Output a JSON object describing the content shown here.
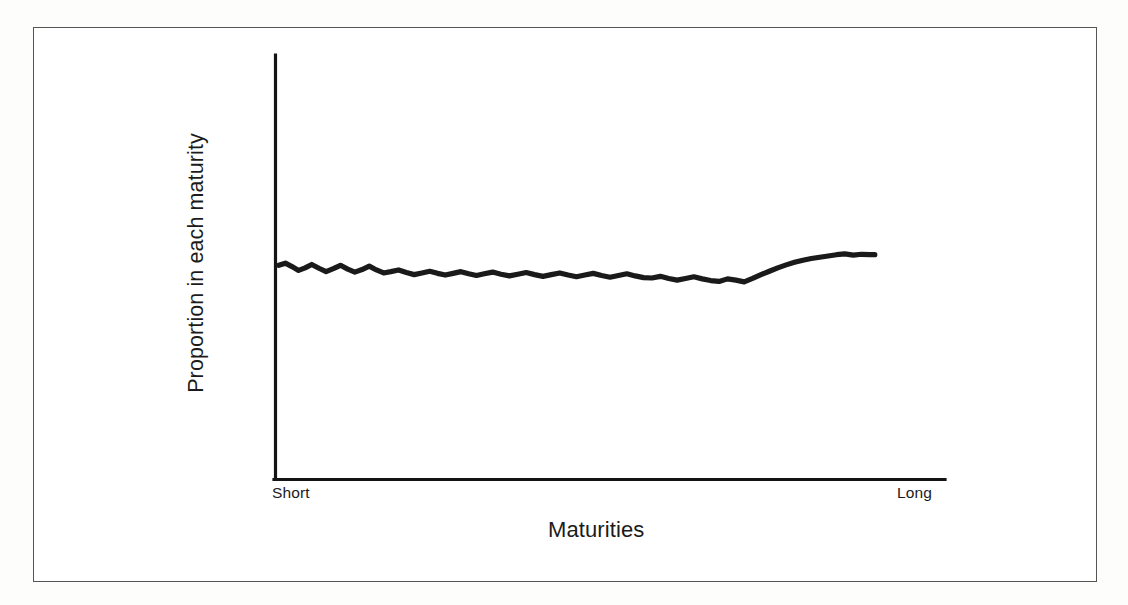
{
  "figure": {
    "background_color": "#ffffff",
    "border_color": "#555558",
    "line_color": "#1a1a1a",
    "text_color": "#1b1b1b"
  },
  "chart_data": {
    "type": "line",
    "title": "",
    "subtitle": "",
    "xlabel": "Maturities",
    "ylabel": "Proportion in each maturity",
    "xtick_labels": [
      "Short",
      "Long"
    ],
    "ytick_labels": [],
    "grid": false,
    "legend": null,
    "axis_style": "open-left-bottom",
    "xlim": [
      0,
      100
    ],
    "ylim": [
      0,
      100
    ],
    "annotation": "Flat, roughly constant proportion across all maturities (ladder / even spread strategy)",
    "series": [
      {
        "name": "Proportion in each maturity",
        "x": [
          0.3,
          1.4,
          2.5,
          3.6,
          4.7,
          5.8,
          7.0,
          8.2,
          9.4,
          10.6,
          11.8,
          13.0,
          14.2,
          15.4,
          16.6,
          17.8,
          19.0,
          20.3,
          21.6,
          22.9,
          24.2,
          25.5,
          26.8,
          28.1,
          29.4,
          30.7,
          32.0,
          33.3,
          34.6,
          36.0,
          37.4,
          38.8,
          40.2,
          41.6,
          43.0,
          44.4,
          45.8,
          47.2,
          48.6,
          50.0,
          51.4,
          52.8,
          54.2,
          55.6,
          57.0,
          58.4,
          59.8,
          61.2,
          62.6,
          64.0,
          65.4,
          66.8,
          68.2,
          69.6,
          71.0,
          72.4,
          73.8,
          75.2,
          76.6,
          78.0,
          79.4,
          80.8,
          82.2,
          83.6,
          85.0,
          86.4,
          87.8,
          89.2,
          90.6,
          92.0,
          93.4,
          94.8,
          96.2,
          97.6,
          99.0,
          99.8
        ],
        "y": [
          50.4,
          50.9,
          50.1,
          49.2,
          49.8,
          50.6,
          49.7,
          48.9,
          49.6,
          50.4,
          49.5,
          48.8,
          49.4,
          50.2,
          49.3,
          48.6,
          48.9,
          49.3,
          48.7,
          48.2,
          48.6,
          49.0,
          48.5,
          48.1,
          48.5,
          48.9,
          48.4,
          48.0,
          48.4,
          48.8,
          48.3,
          47.9,
          48.3,
          48.7,
          48.2,
          47.8,
          48.2,
          48.6,
          48.1,
          47.7,
          48.1,
          48.5,
          48.0,
          47.6,
          48.0,
          48.4,
          47.9,
          47.5,
          47.4,
          47.8,
          47.3,
          46.9,
          47.3,
          47.7,
          47.2,
          46.8,
          46.6,
          47.2,
          46.9,
          46.5,
          47.3,
          48.2,
          49.0,
          49.8,
          50.5,
          51.1,
          51.6,
          52.0,
          52.3,
          52.6,
          52.9,
          53.1,
          52.8,
          53.0,
          52.9,
          52.9
        ]
      }
    ]
  },
  "labels": {
    "x_tick_short": "Short",
    "x_tick_long": "Long",
    "x_axis_title": "Maturities",
    "y_axis_title": "Proportion in each maturity"
  }
}
